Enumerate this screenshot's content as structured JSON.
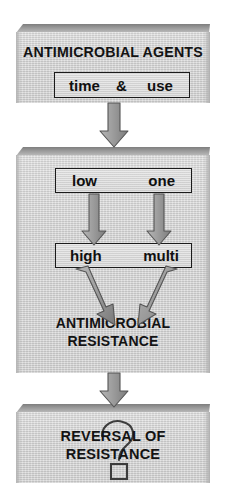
{
  "diagram": {
    "type": "flowchart",
    "colors": {
      "panel_face": "#d4d4d4",
      "panel_bevel": "#8d8d8d",
      "arrow_fill": "#9a9a9a",
      "arrow_stroke": "#4a4a4a",
      "text": "#131313",
      "box_border": "#1b1b1b",
      "background": "#ffffff"
    }
  },
  "stage1": {
    "heading": "ANTIMICROBIAL AGENTS",
    "inner_box": {
      "left_label": "time",
      "operator": "&",
      "right_label": "use"
    }
  },
  "stage2": {
    "exposure_box": {
      "left_label": "low",
      "right_label": "one"
    },
    "outcome_box": {
      "left_label": "high",
      "right_label": "multi"
    },
    "result_line1": "ANTIMICROBIAL",
    "result_line2": "RESISTANCE"
  },
  "stage3": {
    "heading_line1": "REVERSAL OF",
    "heading_line2": "RESISTANCE",
    "watermark": "?"
  },
  "connectors": {
    "agents_to_exposure": "down-arrow",
    "low_to_high": "down-arrow",
    "one_to_multi": "down-arrow",
    "high_to_resistance": "diagonal-down-right-arrow",
    "multi_to_resistance": "diagonal-down-left-arrow",
    "resistance_to_reversal": "down-arrow"
  }
}
